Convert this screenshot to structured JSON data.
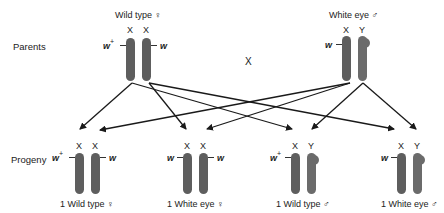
{
  "diagram": {
    "cross_symbol": "X",
    "rows": {
      "parents_label": "Parents",
      "progeny_label": "Progeny"
    },
    "parents": {
      "female": {
        "label": "Wild type ♀",
        "chromosomes": [
          {
            "type": "X",
            "allele": "w",
            "allele_sup": "+"
          },
          {
            "type": "X",
            "allele": "w",
            "allele_sup": ""
          }
        ]
      },
      "male": {
        "label": "White eye ♂",
        "chromosomes": [
          {
            "type": "X",
            "allele": "w",
            "allele_sup": ""
          },
          {
            "type": "Y",
            "allele": "",
            "allele_sup": ""
          }
        ]
      }
    },
    "progeny": [
      {
        "label": "1 Wild type ♀",
        "chromosomes": [
          {
            "type": "X",
            "allele": "w",
            "allele_sup": "+"
          },
          {
            "type": "X",
            "allele": "w",
            "allele_sup": ""
          }
        ]
      },
      {
        "label": "1 White eye ♀",
        "chromosomes": [
          {
            "type": "X",
            "allele": "w",
            "allele_sup": ""
          },
          {
            "type": "X",
            "allele": "w",
            "allele_sup": ""
          }
        ]
      },
      {
        "label": "1 Wild type ♂",
        "chromosomes": [
          {
            "type": "X",
            "allele": "w",
            "allele_sup": "+"
          },
          {
            "type": "Y",
            "allele": "",
            "allele_sup": ""
          }
        ]
      },
      {
        "label": "1 White eye ♂",
        "chromosomes": [
          {
            "type": "X",
            "allele": "w",
            "allele_sup": ""
          },
          {
            "type": "Y",
            "allele": "",
            "allele_sup": ""
          }
        ]
      }
    ],
    "colors": {
      "x_chromosome": "#5e5e5e",
      "y_chromosome": "#6b6b6b",
      "arrow": "#1a1a1a",
      "text": "#222222"
    }
  }
}
